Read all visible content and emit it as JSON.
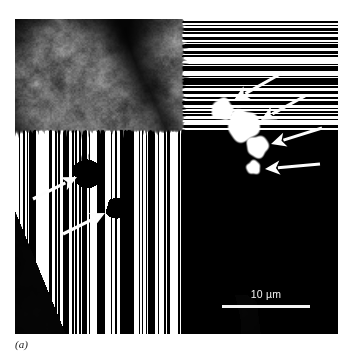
{
  "figure": {
    "caption": "(a)",
    "panel_label": "a",
    "modality": "fluorescence-micrograph",
    "background_color": "#ffffff",
    "panel_color": "#020202"
  },
  "panel": {
    "x": 15,
    "y": 19,
    "width": 323,
    "height": 315
  },
  "scalebar": {
    "label": "10 µm",
    "value": 10,
    "unit": "µm",
    "bar_color": "#f4f4f4",
    "text_color": "#f2f2f2",
    "bar_length_px": 88,
    "x": 207,
    "y": 269
  },
  "cells": [
    {
      "name": "left-cell",
      "cytoplasm_color": "#7d7d7d",
      "nucleus_color": "#050505",
      "puncta": [
        {
          "name": "left-punctum-1",
          "cx": 72,
          "cy": 154,
          "r": 13,
          "color": "#a6a6a6",
          "texture": "speckled"
        },
        {
          "name": "left-punctum-2",
          "cx": 101,
          "cy": 189,
          "r": 9,
          "color": "#9b9b9b",
          "texture": "speckled"
        }
      ]
    },
    {
      "name": "right-cell",
      "cytoplasm_color": "#838383",
      "nucleus_color": "#050505",
      "puncta": [
        {
          "name": "right-punctum-1",
          "cx": 207,
          "cy": 90,
          "r": 11,
          "color": "#a3a3a3",
          "texture": "smooth"
        },
        {
          "name": "right-punctum-2",
          "cx": 228,
          "cy": 106,
          "r": 16,
          "color": "#adadad",
          "texture": "smooth"
        },
        {
          "name": "right-punctum-3",
          "cx": 242,
          "cy": 127,
          "r": 11,
          "color": "#a0a0a0",
          "texture": "smooth"
        },
        {
          "name": "right-punctum-4",
          "cx": 238,
          "cy": 148,
          "r": 7,
          "color": "#9a9a9a",
          "texture": "smooth"
        }
      ]
    }
  ],
  "arrows": {
    "color": "#fdfdfd",
    "count": 6,
    "items": [
      {
        "name": "arrow-left-1",
        "tail_x": 18,
        "tail_y": 180,
        "head_x": 62,
        "head_y": 158,
        "target": "left-punctum-1"
      },
      {
        "name": "arrow-left-2",
        "tail_x": 48,
        "tail_y": 215,
        "head_x": 90,
        "head_y": 194,
        "target": "left-punctum-2"
      },
      {
        "name": "arrow-right-1",
        "tail_x": 267,
        "tail_y": 54,
        "head_x": 219,
        "head_y": 81,
        "target": "right-punctum-1"
      },
      {
        "name": "arrow-right-2",
        "tail_x": 290,
        "tail_y": 77,
        "head_x": 246,
        "head_y": 101,
        "target": "right-punctum-2"
      },
      {
        "name": "arrow-right-3",
        "tail_x": 307,
        "tail_y": 109,
        "head_x": 256,
        "head_y": 125,
        "target": "right-punctum-3"
      },
      {
        "name": "arrow-right-4",
        "tail_x": 305,
        "tail_y": 145,
        "head_x": 250,
        "head_y": 150,
        "target": "right-punctum-4"
      }
    ]
  }
}
